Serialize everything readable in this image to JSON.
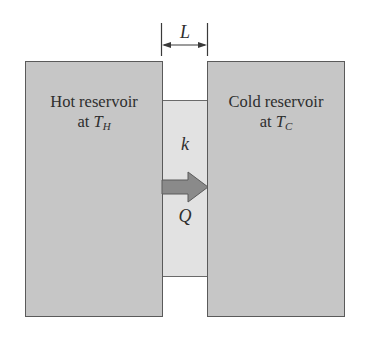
{
  "diagram": {
    "type": "heat-conduction-slab",
    "dimension_label": "L",
    "hot_reservoir": {
      "line1": "Hot reservoir",
      "line2_prefix": "at ",
      "symbol": "T",
      "subscript": "H"
    },
    "cold_reservoir": {
      "line1": "Cold reservoir",
      "line2_prefix": "at ",
      "symbol": "T",
      "subscript": "C"
    },
    "slab": {
      "conductivity_label": "k"
    },
    "heat_flow": {
      "label": "Q",
      "direction": "left-to-right"
    },
    "colors": {
      "reservoir_fill": "#c6c6c6",
      "slab_fill": "#e2e2e2",
      "arrow_fill": "#8a8a8a",
      "outline": "#5a5a5a"
    }
  }
}
